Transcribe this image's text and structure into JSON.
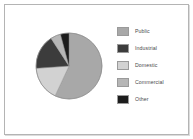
{
  "chart_data": {
    "type": "pie",
    "title": "",
    "subtitle": "",
    "xlabel": "",
    "ylabel": "",
    "legend_position": "right",
    "grid": false,
    "categories": [
      "Public",
      "Industrial",
      "Domestic",
      "Commercial",
      "Other"
    ],
    "values": [
      57,
      17,
      17,
      5,
      4
    ],
    "units": "percent",
    "slices": [
      {
        "label": "Public",
        "value": 57,
        "color": "#a8a8a8",
        "start_angle": 0,
        "end_angle": 205
      },
      {
        "label": "Domestic",
        "value": 17,
        "color": "#d2d2d2",
        "start_angle": 205,
        "end_angle": 266
      },
      {
        "label": "Industrial",
        "value": 17,
        "color": "#3c3c3c",
        "start_angle": 266,
        "end_angle": 327
      },
      {
        "label": "Commercial",
        "value": 5,
        "color": "#b6b6b6",
        "start_angle": 327,
        "end_angle": 345
      },
      {
        "label": "Other",
        "value": 4,
        "color": "#1c1c1c",
        "start_angle": 345,
        "end_angle": 360
      }
    ]
  },
  "legend": {
    "items": [
      {
        "label": "Public",
        "color": "#a8a8a8"
      },
      {
        "label": "Industrial",
        "color": "#3c3c3c"
      },
      {
        "label": "Domestic",
        "color": "#d2d2d2"
      },
      {
        "label": "Commercial",
        "color": "#b6b6b6"
      },
      {
        "label": "Other",
        "color": "#1c1c1c"
      }
    ]
  },
  "style": {
    "background": "#ffffff",
    "frame_border": "#b4b4b4",
    "pie_outline": "#8a8a8a",
    "text_color": "#4a4a4a"
  }
}
